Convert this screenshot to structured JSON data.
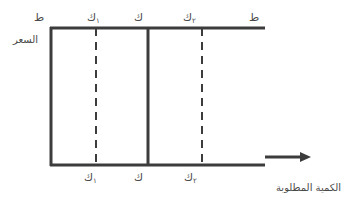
{
  "diagram": {
    "type": "price-quantity-demand-diagram",
    "y_axis": {
      "symbol": "ط",
      "label": "السعر"
    },
    "x_axis": {
      "label": "الكمية المطلوبة",
      "arrow": "right-arrow"
    },
    "top_labels": {
      "price_left": "ط",
      "q1": "ك",
      "q1_sub": "١",
      "q": "ك",
      "q2": "ك",
      "q2_sub": "٢",
      "price_right": "ط"
    },
    "bottom_labels": {
      "q1": "ك",
      "q1_sub": "١",
      "q": "ك",
      "q2": "ك",
      "q2_sub": "٢"
    },
    "lines": [
      {
        "id": "q1",
        "style": "dashed",
        "label": "ك١"
      },
      {
        "id": "q",
        "style": "solid",
        "label": "ك"
      },
      {
        "id": "q2",
        "style": "dashed",
        "label": "ك٢"
      }
    ],
    "colors": {
      "line": "#3c3c3c",
      "text": "#4a4a4a",
      "background": "#ffffff"
    }
  }
}
